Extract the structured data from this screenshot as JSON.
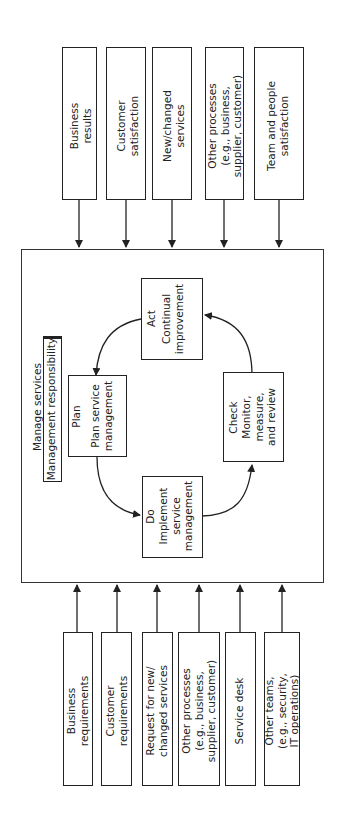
{
  "diagram": {
    "orientation": "rotated-90-ccw",
    "outputs": [
      {
        "label": "Business\nresults"
      },
      {
        "label": "Customer\nsatisfaction"
      },
      {
        "label": "New/changed\nservices"
      },
      {
        "label": "Other processes\n(e.g., business,\nsupplier, customer)"
      },
      {
        "label": "Team and people\nsatisfaction"
      }
    ],
    "central": {
      "title": "Manage services",
      "responsibility": "Management responsibility",
      "cycle": [
        {
          "id": "plan",
          "heading": "Plan",
          "text": "Plan service\nmanagement"
        },
        {
          "id": "do",
          "heading": "Do",
          "text": "Implement\nservice\nmanagement"
        },
        {
          "id": "check",
          "heading": "Check",
          "text": "Monitor, measure,\nand review"
        },
        {
          "id": "act",
          "heading": "Act",
          "text": "Continual\nimprovement"
        }
      ]
    },
    "inputs": [
      {
        "label": "Business\nrequirements"
      },
      {
        "label": "Customer\nrequirements"
      },
      {
        "label": "Request for new/\nchanged services"
      },
      {
        "label": "Other processes\n(e.g., business,\nsupplier, customer)"
      },
      {
        "label": "Service desk"
      },
      {
        "label": "Other teams,\n(e.g., security,\nIT operations)"
      }
    ],
    "colors": {
      "line": "#222222",
      "background": "#ffffff"
    }
  }
}
